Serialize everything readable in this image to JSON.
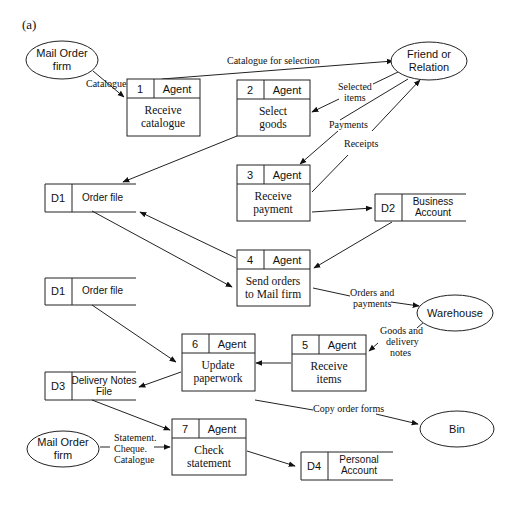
{
  "figure_label": "(a)",
  "external_entities": [
    {
      "id": "mail_order_1",
      "lines": [
        "Mail Order",
        "firm"
      ]
    },
    {
      "id": "friend",
      "lines": [
        "Friend or",
        "Relation"
      ]
    },
    {
      "id": "warehouse",
      "lines": [
        "Warehouse"
      ]
    },
    {
      "id": "bin",
      "lines": [
        "Bin"
      ]
    },
    {
      "id": "mail_order_2",
      "lines": [
        "Mail Order",
        "firm"
      ]
    }
  ],
  "processes": [
    {
      "number": "1",
      "agent": "Agent",
      "lines": [
        "Receive",
        "catalogue"
      ]
    },
    {
      "number": "2",
      "agent": "Agent",
      "lines": [
        "Select",
        "goods"
      ]
    },
    {
      "number": "3",
      "agent": "Agent",
      "lines": [
        "Receive",
        "payment"
      ]
    },
    {
      "number": "4",
      "agent": "Agent",
      "lines": [
        "Send orders",
        "to Mail firm"
      ]
    },
    {
      "number": "5",
      "agent": "Agent",
      "lines": [
        "Receive",
        "items"
      ]
    },
    {
      "number": "6",
      "agent": "Agent",
      "lines": [
        "Update",
        "paperwork"
      ]
    },
    {
      "number": "7",
      "agent": "Agent",
      "lines": [
        "Check",
        "statement"
      ]
    }
  ],
  "data_stores": [
    {
      "id": "D1",
      "lines": [
        "Order file"
      ]
    },
    {
      "id": "D2",
      "lines": [
        "Business",
        "Account"
      ]
    },
    {
      "id": "D1",
      "lines": [
        "Order file"
      ]
    },
    {
      "id": "D3",
      "lines": [
        "Delivery Notes",
        "File"
      ]
    },
    {
      "id": "D4",
      "lines": [
        "Personal",
        "Account"
      ]
    }
  ],
  "flows": {
    "catalogue": "Catalogue",
    "catalogue_for_selection": "Catalogue for selection",
    "selected_items": [
      "Selected",
      "items"
    ],
    "payments": "Payments",
    "receipts": "Receipts",
    "orders_and_payments": [
      "Orders and",
      "payments"
    ],
    "goods_and_delivery_notes": [
      "Goods and",
      "delivery",
      "notes"
    ],
    "copy_order_forms": "Copy order forms",
    "statement_cheque_catalogue": [
      "Statement.",
      "Cheque.",
      "Catalogue"
    ]
  }
}
